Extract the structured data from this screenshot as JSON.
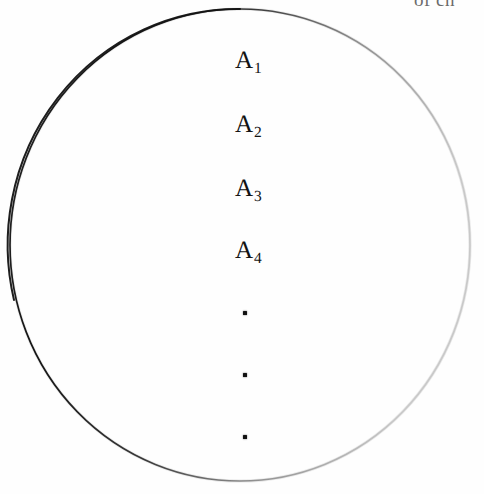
{
  "figure": {
    "kind": "venn-style-set-diagram",
    "background_color": "#fefefe",
    "ink_color": "#131313",
    "canvas": {
      "width": 484,
      "height": 494
    },
    "circle": {
      "center_x": 240,
      "center_y": 245,
      "radius": 230,
      "stroke_color": "#1a1a1a",
      "faded_stroke_color": "#9a9a9a",
      "note": "hand-drawn / photocopied outline, dark at top-left and faint on the right"
    },
    "bleed_text": {
      "text": "of ch",
      "color": "#4b4b4b",
      "note": "clipped text bleeding in from the line above, only letter bottoms visible"
    },
    "set_labels": [
      {
        "base": "A",
        "subscript": "1",
        "x": 248,
        "y": 60
      },
      {
        "base": "A",
        "subscript": "2",
        "x": 248,
        "y": 124
      },
      {
        "base": "A",
        "subscript": "3",
        "x": 248,
        "y": 188
      },
      {
        "base": "A",
        "subscript": "4",
        "x": 248,
        "y": 250
      }
    ],
    "ellipsis_dots": [
      {
        "x": 245,
        "y": 313
      },
      {
        "x": 245,
        "y": 375
      },
      {
        "x": 245,
        "y": 437
      }
    ]
  }
}
